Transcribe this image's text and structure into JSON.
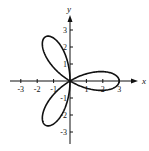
{
  "chart_data": {
    "type": "line",
    "subtype": "polar-rose",
    "title": "",
    "xlabel": "x",
    "ylabel": "y",
    "xlim": [
      -3.5,
      3.5
    ],
    "ylim": [
      -3.5,
      3.5
    ],
    "x_ticks": [
      -3,
      -2,
      -1,
      1,
      2,
      3
    ],
    "y_ticks": [
      3,
      2,
      1,
      -1,
      -2,
      -3
    ],
    "x_tick_labels": [
      "-3",
      "-2",
      "-1",
      "1",
      "2",
      "3"
    ],
    "y_tick_labels": [
      "3",
      "2",
      "1",
      "-1",
      "-2",
      "-3"
    ],
    "grid": false,
    "legend": null,
    "series": [
      {
        "name": "rose curve (3 petals)",
        "equation": "r = 3cos(3θ)",
        "petal_tips": [
          [
            3,
            0
          ],
          [
            -1.5,
            2.6
          ],
          [
            -1.5,
            -2.6
          ]
        ]
      }
    ]
  }
}
